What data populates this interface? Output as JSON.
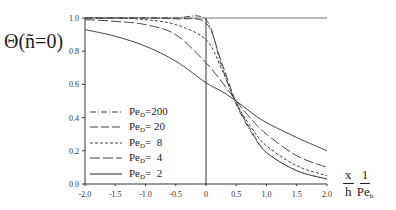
{
  "chart_data": {
    "type": "line",
    "title": "",
    "ylabel": "Θ(ñ=0)",
    "xlabel": {
      "top_left": "x",
      "top_right": "1",
      "bottom_left": "h",
      "bottom_right": "Pe",
      "bottom_right_sub": "h"
    },
    "xlim": [
      -2.0,
      2.0
    ],
    "ylim": [
      0.0,
      1.0
    ],
    "xticks": [
      "-2.0",
      "-1.5",
      "-1.0",
      "-0.5",
      "0",
      "0.5",
      "1.0",
      "1.5",
      "2.0"
    ],
    "yticks": [
      "0.0",
      "0.2",
      "0.4",
      "0.6",
      "0.8",
      "1.0"
    ],
    "grid": false,
    "legend_position": "lower-left",
    "x": [
      -2.0,
      -1.5,
      -1.0,
      -0.5,
      0.0,
      0.25,
      0.5,
      0.75,
      1.0,
      1.5,
      2.0
    ],
    "series": [
      {
        "name": "Pe_D = 200",
        "pe": "200",
        "dash": "6,2,1,2",
        "values": [
          1.0,
          1.0,
          1.0,
          1.0,
          0.99,
          0.72,
          0.48,
          0.31,
          0.19,
          0.08,
          0.03
        ]
      },
      {
        "name": "Pe_D = 20",
        "pe": "20",
        "dash": "8,3",
        "values": [
          1.0,
          1.0,
          1.0,
          0.995,
          0.97,
          0.74,
          0.49,
          0.32,
          0.19,
          0.08,
          0.03
        ]
      },
      {
        "name": "Pe_D = 8",
        "pe": "8",
        "dash": "3,2",
        "values": [
          1.0,
          1.0,
          0.99,
          0.96,
          0.87,
          0.7,
          0.49,
          0.34,
          0.23,
          0.11,
          0.05
        ]
      },
      {
        "name": "Pe_D = 4",
        "pe": "4",
        "dash": "10,3",
        "values": [
          0.99,
          0.98,
          0.96,
          0.9,
          0.73,
          0.62,
          0.5,
          0.39,
          0.3,
          0.17,
          0.1
        ]
      },
      {
        "name": "Pe_D = 2",
        "pe": "2",
        "dash": "",
        "values": [
          0.93,
          0.89,
          0.83,
          0.74,
          0.61,
          0.56,
          0.5,
          0.43,
          0.37,
          0.28,
          0.2
        ]
      }
    ]
  },
  "legend": {
    "prefix": "Pe",
    "sub": "D",
    "eq": "=",
    "items": [
      "200",
      " 20",
      "  8",
      "  4",
      "  2"
    ]
  }
}
